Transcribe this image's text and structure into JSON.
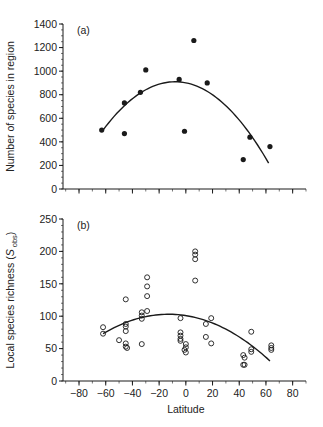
{
  "chart_data": [
    {
      "type": "scatter",
      "panel_label": "(a)",
      "title": "",
      "xlabel": "",
      "ylabel": "Number of species in region",
      "xlim": [
        -92,
        90
      ],
      "ylim": [
        0,
        1400
      ],
      "x_ticks": [
        -80,
        -60,
        -40,
        -20,
        0,
        20,
        40,
        60,
        80
      ],
      "x_tick_labels_shown": false,
      "y_ticks": [
        0,
        200,
        400,
        600,
        800,
        1000,
        1200,
        1400
      ],
      "y_tick_labels": [
        "0",
        "200",
        "400",
        "600",
        "800",
        "1000",
        "1200",
        "1400"
      ],
      "y_minor_step": 50,
      "x_minor_step": 10,
      "grid": false,
      "marker": "filled-circle",
      "series": [
        {
          "name": "regions",
          "points": [
            {
              "x": -63,
              "y": 500
            },
            {
              "x": -46,
              "y": 470
            },
            {
              "x": -46,
              "y": 730
            },
            {
              "x": -34,
              "y": 820
            },
            {
              "x": -30,
              "y": 1010
            },
            {
              "x": -5,
              "y": 930
            },
            {
              "x": -1,
              "y": 490
            },
            {
              "x": 6,
              "y": 1260
            },
            {
              "x": 16,
              "y": 900
            },
            {
              "x": 43,
              "y": 250
            },
            {
              "x": 48,
              "y": 440
            },
            {
              "x": 63,
              "y": 360
            }
          ]
        }
      ],
      "fit_curve": {
        "type": "quadratic",
        "x_range": [
          -62,
          62
        ],
        "points": [
          {
            "x": -62,
            "y": 500
          },
          {
            "x": -8,
            "y": 910
          },
          {
            "x": 62,
            "y": 220
          }
        ]
      }
    },
    {
      "type": "scatter",
      "panel_label": "(b)",
      "title": "",
      "xlabel": "Latitude",
      "ylabel": "Local species richness (S",
      "ylabel_subscript": "obs",
      "ylabel_suffix": ")",
      "xlim": [
        -92,
        90
      ],
      "ylim": [
        0,
        250
      ],
      "x_ticks": [
        -80,
        -60,
        -40,
        -20,
        0,
        20,
        40,
        60,
        80
      ],
      "x_tick_labels": [
        "−80",
        "−60",
        "−40",
        "−20",
        "0",
        "20",
        "40",
        "60",
        "80"
      ],
      "y_ticks": [
        0,
        50,
        100,
        150,
        200,
        250
      ],
      "y_tick_labels": [
        "0",
        "50",
        "100",
        "150",
        "200",
        "250"
      ],
      "y_minor_step": 10,
      "x_minor_step": 10,
      "grid": false,
      "marker": "open-circle",
      "series": [
        {
          "name": "local sites",
          "points": [
            {
              "x": -62,
              "y": 83
            },
            {
              "x": -62,
              "y": 73
            },
            {
              "x": -50,
              "y": 63
            },
            {
              "x": -45,
              "y": 126
            },
            {
              "x": -45,
              "y": 88
            },
            {
              "x": -45,
              "y": 84
            },
            {
              "x": -45,
              "y": 77
            },
            {
              "x": -45,
              "y": 58
            },
            {
              "x": -45,
              "y": 53
            },
            {
              "x": -44,
              "y": 51
            },
            {
              "x": -33,
              "y": 106
            },
            {
              "x": -33,
              "y": 101
            },
            {
              "x": -33,
              "y": 96
            },
            {
              "x": -33,
              "y": 57
            },
            {
              "x": -29,
              "y": 160
            },
            {
              "x": -29,
              "y": 146
            },
            {
              "x": -29,
              "y": 131
            },
            {
              "x": -29,
              "y": 108
            },
            {
              "x": -4,
              "y": 97
            },
            {
              "x": -4,
              "y": 75
            },
            {
              "x": -4,
              "y": 70
            },
            {
              "x": -4,
              "y": 65
            },
            {
              "x": -4,
              "y": 62
            },
            {
              "x": 0,
              "y": 57
            },
            {
              "x": 0,
              "y": 52
            },
            {
              "x": -1,
              "y": 48
            },
            {
              "x": 0,
              "y": 44
            },
            {
              "x": 7,
              "y": 200
            },
            {
              "x": 7,
              "y": 195
            },
            {
              "x": 7,
              "y": 188
            },
            {
              "x": 7,
              "y": 155
            },
            {
              "x": 15,
              "y": 88
            },
            {
              "x": 15,
              "y": 68
            },
            {
              "x": 19,
              "y": 97
            },
            {
              "x": 19,
              "y": 58
            },
            {
              "x": 43,
              "y": 40
            },
            {
              "x": 44,
              "y": 36
            },
            {
              "x": 43,
              "y": 25
            },
            {
              "x": 44,
              "y": 25
            },
            {
              "x": 49,
              "y": 76
            },
            {
              "x": 49,
              "y": 49
            },
            {
              "x": 49,
              "y": 45
            },
            {
              "x": 64,
              "y": 55
            },
            {
              "x": 64,
              "y": 51
            },
            {
              "x": 64,
              "y": 48
            }
          ]
        }
      ],
      "fit_curve": {
        "type": "quadratic",
        "x_range": [
          -62,
          63
        ],
        "points": [
          {
            "x": -62,
            "y": 73
          },
          {
            "x": -14,
            "y": 103
          },
          {
            "x": 63,
            "y": 31
          }
        ]
      }
    }
  ],
  "colors": {
    "ink": "#1a1a1a",
    "background": "#ffffff"
  }
}
